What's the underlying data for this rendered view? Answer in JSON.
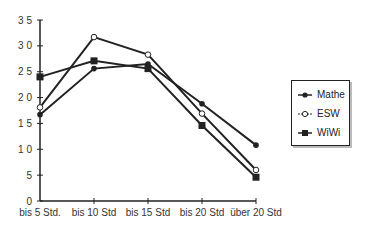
{
  "chart_data": {
    "type": "line",
    "title": "",
    "xlabel": "",
    "ylabel": "",
    "categories": [
      "bis 5 Std.",
      "bis 10 Std",
      "bis 15 Std",
      "bis 20 Std",
      "über 20 Std"
    ],
    "ylim": [
      0,
      35
    ],
    "yticks": [
      "0",
      "5",
      "1 0",
      "1 5",
      "2 0",
      "2 5",
      "3 0",
      "3 5"
    ],
    "ytick_values": [
      0,
      5,
      10,
      15,
      20,
      25,
      30,
      35
    ],
    "grid": false,
    "legend_position": "right",
    "series": [
      {
        "name": "Mathe",
        "marker": "filled-circle",
        "values": [
          16.7,
          25.6,
          26.5,
          18.8,
          10.8
        ]
      },
      {
        "name": "ESW",
        "marker": "open-circle",
        "values": [
          18.1,
          31.7,
          28.3,
          16.9,
          6.0
        ]
      },
      {
        "name": "WiWi",
        "marker": "filled-square",
        "values": [
          24.0,
          27.1,
          25.6,
          14.6,
          4.6
        ]
      }
    ],
    "colors": {
      "line": "#222222",
      "axis": "#222222"
    }
  }
}
